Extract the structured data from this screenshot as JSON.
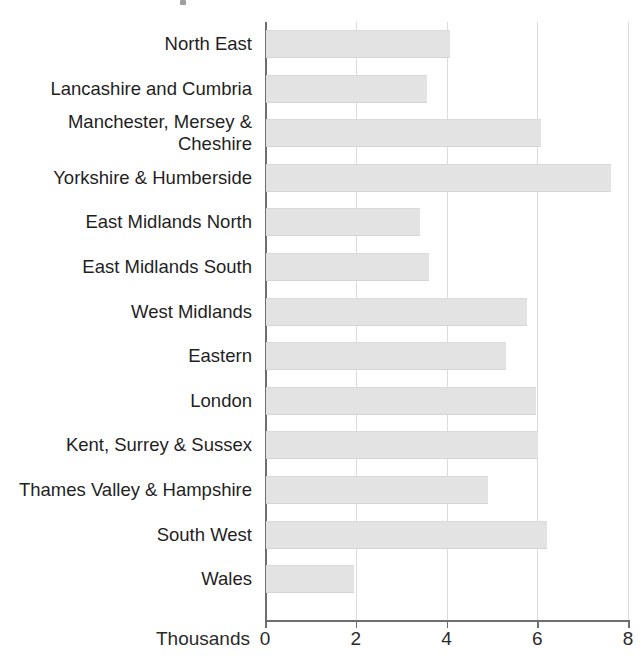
{
  "chart_data": {
    "type": "bar",
    "orientation": "horizontal",
    "title": "",
    "xlabel": "Thousands",
    "ylabel": "",
    "xlim": [
      0,
      8
    ],
    "xticks": [
      0,
      2,
      4,
      6,
      8
    ],
    "xtick_labels": [
      "0",
      "2",
      "4",
      "6",
      "8"
    ],
    "grid": "vertical",
    "legend": "none",
    "bar_color": "#e3e3e3",
    "axis_color": "#6e6e6e",
    "grid_color": "#dcdcdc",
    "categories": [
      "North East",
      "Lancashire and Cumbria",
      "Manchester, Mersey &\nCheshire",
      "Yorkshire & Humberside",
      "East Midlands North",
      "East Midlands South",
      "West Midlands",
      "Eastern",
      "London",
      "Kent, Surrey & Sussex",
      "Thames Valley & Hampshire",
      "South West",
      "Wales"
    ],
    "values": [
      4.05,
      3.55,
      6.05,
      7.6,
      3.4,
      3.6,
      5.75,
      5.3,
      5.95,
      6.0,
      4.9,
      6.2,
      1.95
    ]
  }
}
